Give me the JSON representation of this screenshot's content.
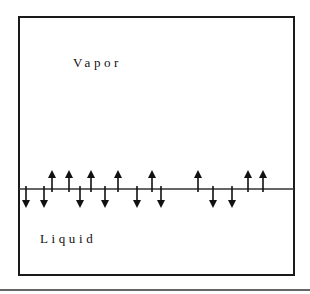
{
  "diagram": {
    "labels": {
      "vapor": "Vapor",
      "liquid": "Liquid"
    },
    "box": {
      "x": 19,
      "y": 17,
      "width": 275,
      "height": 258,
      "stroke": "#1a1a1a"
    },
    "interface_line": {
      "y": 189,
      "x1": 19,
      "x2": 294,
      "stroke": "#333333"
    },
    "bottom_rule": {
      "y": 290,
      "x1": 0,
      "x2": 310,
      "stroke": "#333333"
    },
    "arrows": [
      {
        "x": 26,
        "direction": "down"
      },
      {
        "x": 44,
        "direction": "down"
      },
      {
        "x": 52,
        "direction": "up"
      },
      {
        "x": 69,
        "direction": "up"
      },
      {
        "x": 80,
        "direction": "down"
      },
      {
        "x": 91,
        "direction": "up"
      },
      {
        "x": 105,
        "direction": "down"
      },
      {
        "x": 118,
        "direction": "up"
      },
      {
        "x": 137,
        "direction": "down"
      },
      {
        "x": 152,
        "direction": "up"
      },
      {
        "x": 161,
        "direction": "down"
      },
      {
        "x": 198,
        "direction": "up"
      },
      {
        "x": 213,
        "direction": "down"
      },
      {
        "x": 232,
        "direction": "down"
      },
      {
        "x": 248,
        "direction": "up"
      },
      {
        "x": 263,
        "direction": "up"
      }
    ]
  }
}
